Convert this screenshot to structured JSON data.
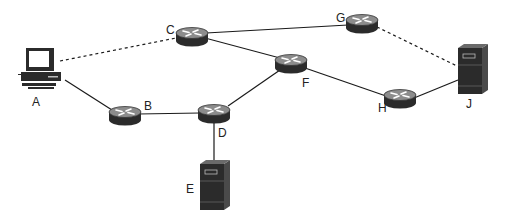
{
  "diagram": {
    "type": "network-topology",
    "nodes": [
      {
        "id": "A",
        "label": "A",
        "kind": "computer"
      },
      {
        "id": "B",
        "label": "B",
        "kind": "router"
      },
      {
        "id": "C",
        "label": "C",
        "kind": "router"
      },
      {
        "id": "D",
        "label": "D",
        "kind": "router"
      },
      {
        "id": "E",
        "label": "E",
        "kind": "server"
      },
      {
        "id": "F",
        "label": "F",
        "kind": "router"
      },
      {
        "id": "G",
        "label": "G",
        "kind": "router"
      },
      {
        "id": "H",
        "label": "H",
        "kind": "router"
      },
      {
        "id": "J",
        "label": "J",
        "kind": "server"
      }
    ],
    "links": [
      {
        "from": "A",
        "to": "C",
        "style": "dashed"
      },
      {
        "from": "A",
        "to": "B",
        "style": "solid"
      },
      {
        "from": "B",
        "to": "D",
        "style": "solid"
      },
      {
        "from": "D",
        "to": "E",
        "style": "solid"
      },
      {
        "from": "D",
        "to": "F",
        "style": "solid"
      },
      {
        "from": "C",
        "to": "F",
        "style": "solid"
      },
      {
        "from": "C",
        "to": "G",
        "style": "solid"
      },
      {
        "from": "F",
        "to": "H",
        "style": "solid"
      },
      {
        "from": "H",
        "to": "J",
        "style": "solid"
      },
      {
        "from": "G",
        "to": "J",
        "style": "dashed"
      }
    ],
    "colors": {
      "device": "#2b2b2b",
      "device_top": "#8a8a8a",
      "link": "#1a1a1a"
    }
  }
}
